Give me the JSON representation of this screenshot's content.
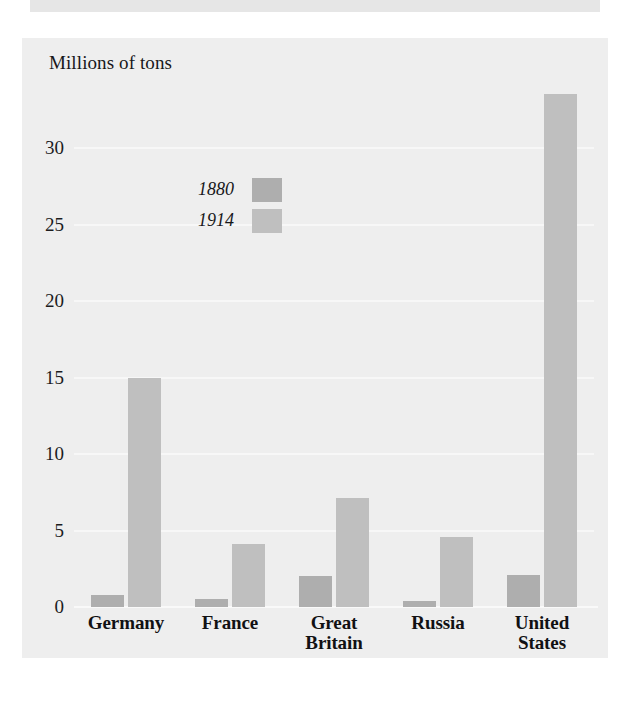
{
  "figure": {
    "scan_strip_label": "page-scan-strip"
  },
  "chart_data": {
    "type": "bar",
    "title": "Millions of tons",
    "xlabel": "",
    "ylabel": "Millions of tons",
    "ylim": [
      0,
      35
    ],
    "yticks": [
      0,
      5,
      10,
      15,
      20,
      25,
      30
    ],
    "ytick_labels": [
      "0",
      "5",
      "10",
      "15",
      "20",
      "25",
      "30"
    ],
    "grid": true,
    "legend_position": "upper-left-inside",
    "categories": [
      "Germany",
      "France",
      "Great Britain",
      "Russia",
      "United States"
    ],
    "category_label_lines": [
      [
        "Germany"
      ],
      [
        "France"
      ],
      [
        "Great",
        "Britain"
      ],
      [
        "Russia"
      ],
      [
        "United",
        "States"
      ]
    ],
    "series": [
      {
        "name": "1880",
        "color": "#aeaeae",
        "values": [
          0.8,
          0.5,
          2.0,
          0.4,
          2.1
        ]
      },
      {
        "name": "1914",
        "color": "#bfbfbf",
        "values": [
          15.0,
          4.1,
          7.1,
          4.6,
          33.5
        ]
      }
    ]
  },
  "legend": {
    "entries": [
      {
        "label": "1880",
        "color": "#aeaeae"
      },
      {
        "label": "1914",
        "color": "#bfbfbf"
      }
    ]
  },
  "colors": {
    "panel_background": "#eeeeee",
    "page_background": "#ffffff",
    "gridline": "#f7f7f7",
    "text": "#17171a",
    "series_1880": "#aeaeae",
    "series_1914": "#bfbfbf"
  }
}
